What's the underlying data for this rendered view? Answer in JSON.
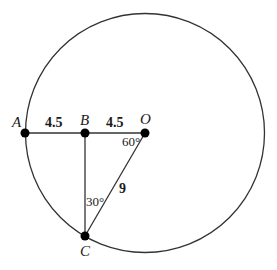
{
  "figure": {
    "points": {
      "A": "A",
      "B": "B",
      "O": "O",
      "C": "C"
    },
    "lengths": {
      "AB": "4.5",
      "BO": "4.5",
      "OC": "9"
    },
    "angles": {
      "at_O": "60°",
      "at_C": "30°"
    },
    "colors": {
      "stroke": "#333333",
      "point": "#000000"
    }
  }
}
